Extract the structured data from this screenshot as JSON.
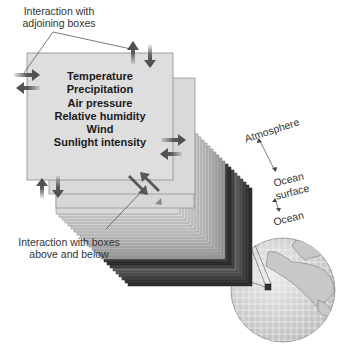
{
  "diagram": {
    "type": "climate model grid box schematic",
    "labels": {
      "adjoining": [
        "Interaction with",
        "adjoining boxes"
      ],
      "above_below": [
        "Interaction with boxes",
        "above and below"
      ],
      "atmosphere": "Atmosphere",
      "ocean_surface": [
        "Ocean",
        "surface"
      ],
      "ocean": "Ocean"
    },
    "box_variables": [
      "Temperature",
      "Precipitation",
      "Air pressure",
      "Relative humidity",
      "Wind",
      "Sunlight intensity"
    ],
    "colors": {
      "front_box": "#dcdcdc",
      "box_border": "#8a8a8a",
      "arrow": "#5a5a5a",
      "dark_layers": "#3a3a3a",
      "globe_fill": "#d8d8d8",
      "globe_grid": "#f4f4f4"
    }
  }
}
